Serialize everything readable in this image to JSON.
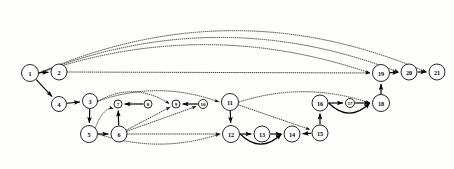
{
  "diagram": {
    "type": "directed-graph",
    "title": "",
    "background_color": "#fdfdfb",
    "node_fill_color": "#ffffff",
    "node_stroke_color": "#111111",
    "solid_edge_color": "#000000",
    "dotted_edge_color": "#1a1a1a",
    "node_count": 21,
    "nodes": [
      {
        "id": "1",
        "label": "1",
        "x": 30,
        "y": 73,
        "r": 8.5
      },
      {
        "id": "2",
        "label": "2",
        "x": 59,
        "y": 72,
        "r": 8.0
      },
      {
        "id": "3",
        "label": "3",
        "x": 90,
        "y": 101,
        "r": 7.5
      },
      {
        "id": "4",
        "label": "4",
        "x": 59,
        "y": 104,
        "r": 7.5
      },
      {
        "id": "5",
        "label": "5",
        "x": 89,
        "y": 134,
        "r": 8.5
      },
      {
        "id": "6",
        "label": "6",
        "x": 119,
        "y": 134,
        "r": 8.0
      },
      {
        "id": "7",
        "label": "7",
        "x": 118,
        "y": 104,
        "r": 4.0
      },
      {
        "id": "8",
        "label": "8",
        "x": 148,
        "y": 104,
        "r": 4.0
      },
      {
        "id": "9",
        "label": "9",
        "x": 176,
        "y": 104,
        "r": 4.0
      },
      {
        "id": "10",
        "label": "10",
        "x": 203,
        "y": 104,
        "r": 4.5
      },
      {
        "id": "11",
        "label": "11",
        "x": 230,
        "y": 102,
        "r": 8.5
      },
      {
        "id": "12",
        "label": "12",
        "x": 231,
        "y": 134,
        "r": 8.5
      },
      {
        "id": "13",
        "label": "13",
        "x": 262,
        "y": 134,
        "r": 8.0
      },
      {
        "id": "14",
        "label": "14",
        "x": 292,
        "y": 134,
        "r": 8.0
      },
      {
        "id": "15",
        "label": "15",
        "x": 320,
        "y": 133,
        "r": 8.0
      },
      {
        "id": "16",
        "label": "16",
        "x": 320,
        "y": 103,
        "r": 8.0
      },
      {
        "id": "17",
        "label": "17",
        "x": 350,
        "y": 103,
        "r": 4.5
      },
      {
        "id": "18",
        "label": "18",
        "x": 381,
        "y": 103,
        "r": 8.5
      },
      {
        "id": "19",
        "label": "19",
        "x": 381,
        "y": 73,
        "r": 8.5
      },
      {
        "id": "20",
        "label": "20",
        "x": 409,
        "y": 72,
        "r": 8.0
      },
      {
        "id": "21",
        "label": "21",
        "x": 437,
        "y": 72,
        "r": 8.0
      }
    ],
    "edges": [
      {
        "from": "1",
        "to": "2",
        "style": "solid",
        "shape": "straight"
      },
      {
        "from": "1",
        "to": "4",
        "style": "solid",
        "shape": "straight"
      },
      {
        "from": "4",
        "to": "3",
        "style": "solid",
        "shape": "straight"
      },
      {
        "from": "3",
        "to": "5",
        "style": "solid",
        "shape": "straight"
      },
      {
        "from": "5",
        "to": "6",
        "style": "solid",
        "shape": "straight"
      },
      {
        "from": "6",
        "to": "7",
        "style": "solid",
        "shape": "straight"
      },
      {
        "from": "8",
        "to": "7",
        "style": "solid",
        "shape": "straight"
      },
      {
        "from": "10",
        "to": "9",
        "style": "solid",
        "shape": "straight"
      },
      {
        "from": "11",
        "to": "12",
        "style": "solid",
        "shape": "straight"
      },
      {
        "from": "12",
        "to": "13",
        "style": "solid",
        "shape": "straight"
      },
      {
        "from": "13",
        "to": "14",
        "style": "solid",
        "shape": "straight"
      },
      {
        "from": "15",
        "to": "14",
        "style": "solid",
        "shape": "straight"
      },
      {
        "from": "15",
        "to": "16",
        "style": "solid",
        "shape": "straight"
      },
      {
        "from": "16",
        "to": "17",
        "style": "solid",
        "shape": "straight"
      },
      {
        "from": "17",
        "to": "18",
        "style": "solid",
        "shape": "straight"
      },
      {
        "from": "18",
        "to": "19",
        "style": "solid",
        "shape": "straight"
      },
      {
        "from": "19",
        "to": "20",
        "style": "solid",
        "shape": "straight"
      },
      {
        "from": "20",
        "to": "21",
        "style": "solid",
        "shape": "straight"
      },
      {
        "from": "12",
        "to": "14",
        "style": "solid",
        "shape": "arc-below"
      },
      {
        "from": "16",
        "to": "18",
        "style": "solid",
        "shape": "arc-below"
      },
      {
        "from": "1",
        "to": "19",
        "style": "dotted",
        "shape": "arc-high"
      },
      {
        "from": "1",
        "to": "20",
        "style": "dotted",
        "shape": "arc-higher"
      },
      {
        "from": "1",
        "to": "21",
        "style": "dotted",
        "shape": "arc-highest"
      },
      {
        "from": "2",
        "to": "19",
        "style": "dotted",
        "shape": "straight"
      },
      {
        "from": "3",
        "to": "9",
        "style": "dotted",
        "shape": "arc-above"
      },
      {
        "from": "3",
        "to": "11",
        "style": "dotted",
        "shape": "arc-above"
      },
      {
        "from": "5",
        "to": "7",
        "style": "dotted",
        "shape": "arc"
      },
      {
        "from": "6",
        "to": "9",
        "style": "dotted",
        "shape": "straight"
      },
      {
        "from": "6",
        "to": "10",
        "style": "dotted",
        "shape": "straight"
      },
      {
        "from": "6",
        "to": "12",
        "style": "dotted",
        "shape": "straight"
      },
      {
        "from": "5",
        "to": "12",
        "style": "dotted",
        "shape": "arc-below"
      },
      {
        "from": "11",
        "to": "18",
        "style": "dotted",
        "shape": "arc-above"
      },
      {
        "from": "11",
        "to": "15",
        "style": "dotted",
        "shape": "straight"
      }
    ]
  }
}
